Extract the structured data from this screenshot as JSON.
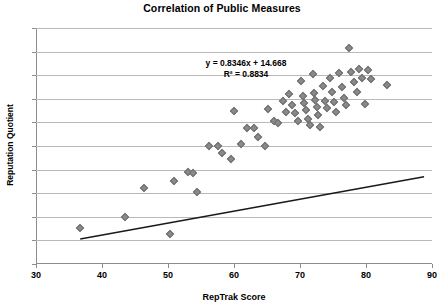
{
  "chart_data": {
    "type": "scatter",
    "title": "Correlation of Public Measures",
    "xlabel": "RepTrak Score",
    "ylabel": "Reputation Quotient",
    "xlim": [
      30,
      90
    ],
    "ylim": [
      40,
      90
    ],
    "xticks": [
      30,
      40,
      50,
      60,
      70,
      80,
      90
    ],
    "yticks": [
      40,
      45,
      50,
      55,
      60,
      65,
      70,
      75,
      80,
      85,
      90
    ],
    "grid": true,
    "legend": "none",
    "annotations": {
      "equation": "y = 0.8346x + 14.668",
      "r_squared": "R² = 0.8834"
    },
    "trendline": {
      "slope": 0.8346,
      "intercept": 14.668,
      "x_start": 36.7,
      "x_end": 88.8,
      "y_start": 45.3,
      "y_end": 58.5
    },
    "marker": {
      "shape": "diamond",
      "color": "#8a8a8a",
      "edge": "#6e6e6e",
      "size": 6
    },
    "points": [
      [
        36.7,
        47.6
      ],
      [
        43.5,
        50.0
      ],
      [
        46.4,
        56.0
      ],
      [
        50.3,
        46.4
      ],
      [
        50.9,
        57.6
      ],
      [
        53.0,
        59.4
      ],
      [
        53.8,
        59.3
      ],
      [
        54.4,
        55.2
      ],
      [
        56.2,
        65.0
      ],
      [
        57.6,
        65.0
      ],
      [
        58.2,
        63.5
      ],
      [
        59.5,
        62.3
      ],
      [
        60.0,
        72.4
      ],
      [
        61.1,
        65.5
      ],
      [
        61.9,
        68.9
      ],
      [
        63.0,
        68.8
      ],
      [
        63.6,
        66.9
      ],
      [
        64.7,
        65.0
      ],
      [
        65.2,
        72.8
      ],
      [
        66.0,
        70.3
      ],
      [
        66.6,
        69.9
      ],
      [
        67.4,
        74.5
      ],
      [
        67.9,
        72.1
      ],
      [
        68.3,
        76.0
      ],
      [
        68.8,
        73.7
      ],
      [
        69.2,
        72.0
      ],
      [
        69.7,
        70.2
      ],
      [
        70.1,
        78.8
      ],
      [
        70.4,
        75.6
      ],
      [
        70.6,
        74.1
      ],
      [
        70.9,
        72.6
      ],
      [
        71.2,
        70.7
      ],
      [
        71.5,
        69.4
      ],
      [
        71.9,
        80.2
      ],
      [
        72.1,
        76.2
      ],
      [
        72.3,
        74.8
      ],
      [
        72.6,
        73.3
      ],
      [
        72.8,
        71.6
      ],
      [
        73.1,
        69.1
      ],
      [
        73.5,
        77.8
      ],
      [
        73.8,
        74.6
      ],
      [
        74.1,
        73.0
      ],
      [
        74.5,
        79.4
      ],
      [
        74.9,
        76.4
      ],
      [
        75.2,
        74.4
      ],
      [
        75.5,
        72.2
      ],
      [
        75.9,
        80.4
      ],
      [
        76.3,
        77.5
      ],
      [
        76.7,
        75.2
      ],
      [
        77.0,
        73.6
      ],
      [
        77.4,
        85.7
      ],
      [
        77.8,
        80.6
      ],
      [
        78.2,
        78.5
      ],
      [
        78.6,
        76.4
      ],
      [
        79.0,
        81.3
      ],
      [
        79.4,
        79.4
      ],
      [
        79.8,
        73.8
      ],
      [
        80.3,
        81.0
      ],
      [
        80.8,
        79.2
      ],
      [
        83.2,
        77.9
      ]
    ]
  }
}
